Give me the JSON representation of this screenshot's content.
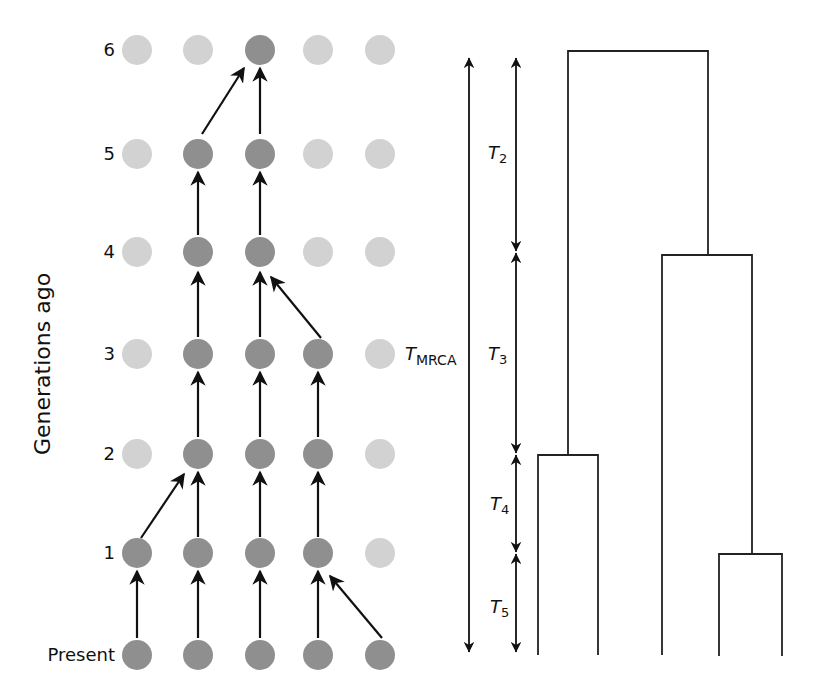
{
  "figure": {
    "y_axis_title": "Generations ago",
    "row_labels": [
      "6",
      "5",
      "4",
      "3",
      "2",
      "1",
      "Present"
    ],
    "colors": {
      "ancestor_dot": "#8f8f8f",
      "other_dot": "#d2d2d2",
      "arrow": "#111111",
      "tree_line": "#222222"
    },
    "time_labels": {
      "t_mrca_main": "T",
      "t_mrca_sub": "MRCA",
      "t2_main": "T",
      "t2_sub": "2",
      "t3_main": "T",
      "t3_sub": "3",
      "t4_main": "T",
      "t4_sub": "4",
      "t5_main": "T",
      "t5_sub": "5"
    },
    "generations": [
      {
        "label": "6",
        "ancestral": [
          false,
          false,
          true,
          false,
          false
        ]
      },
      {
        "label": "5",
        "ancestral": [
          false,
          true,
          true,
          false,
          false
        ]
      },
      {
        "label": "4",
        "ancestral": [
          false,
          true,
          true,
          false,
          false
        ]
      },
      {
        "label": "3",
        "ancestral": [
          false,
          true,
          true,
          true,
          false
        ]
      },
      {
        "label": "2",
        "ancestral": [
          false,
          true,
          true,
          true,
          false
        ]
      },
      {
        "label": "1",
        "ancestral": [
          true,
          true,
          true,
          true,
          false
        ]
      },
      {
        "label": "Present",
        "ancestral": [
          true,
          true,
          true,
          true,
          true
        ]
      }
    ],
    "lineage_links": [
      {
        "from_gen": "5",
        "from_col": 2,
        "to_col": 3
      },
      {
        "from_gen": "5",
        "from_col": 3,
        "to_col": 3
      },
      {
        "from_gen": "4",
        "from_col": 2,
        "to_col": 2
      },
      {
        "from_gen": "4",
        "from_col": 3,
        "to_col": 3
      },
      {
        "from_gen": "3",
        "from_col": 2,
        "to_col": 2
      },
      {
        "from_gen": "3",
        "from_col": 3,
        "to_col": 3
      },
      {
        "from_gen": "3",
        "from_col": 4,
        "to_col": 3
      },
      {
        "from_gen": "2",
        "from_col": 2,
        "to_col": 2
      },
      {
        "from_gen": "2",
        "from_col": 3,
        "to_col": 3
      },
      {
        "from_gen": "2",
        "from_col": 4,
        "to_col": 4
      },
      {
        "from_gen": "1",
        "from_col": 1,
        "to_col": 2
      },
      {
        "from_gen": "1",
        "from_col": 2,
        "to_col": 2
      },
      {
        "from_gen": "1",
        "from_col": 3,
        "to_col": 3
      },
      {
        "from_gen": "1",
        "from_col": 4,
        "to_col": 4
      },
      {
        "from_gen": "Present",
        "from_col": 1,
        "to_col": 1
      },
      {
        "from_gen": "Present",
        "from_col": 2,
        "to_col": 2
      },
      {
        "from_gen": "Present",
        "from_col": 3,
        "to_col": 3
      },
      {
        "from_gen": "Present",
        "from_col": 4,
        "to_col": 4
      },
      {
        "from_gen": "Present",
        "from_col": 5,
        "to_col": 4
      }
    ],
    "coalescent_tree": {
      "leaves": 5,
      "coalescence_generations": {
        "root": 6,
        "second": 4,
        "third": 2,
        "fourth": 1
      }
    }
  }
}
